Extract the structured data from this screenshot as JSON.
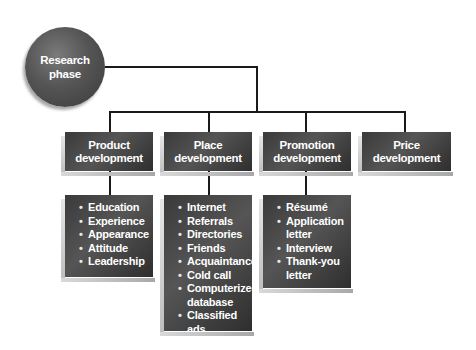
{
  "root": {
    "label_line1": "Research",
    "label_line2": "phase"
  },
  "categories": [
    {
      "line1": "Product",
      "line2": "development",
      "items": [
        "Education",
        "Experience",
        "Appearance",
        "Attitude",
        "Leadership"
      ]
    },
    {
      "line1": "Place",
      "line2": "development",
      "items": [
        "Internet",
        "Referrals",
        "Directories",
        "Friends",
        "Acquaintances",
        "Cold call",
        "Computerized database",
        "Classified ads"
      ]
    },
    {
      "line1": "Promotion",
      "line2": "development",
      "items": [
        "Résumé",
        "Application letter",
        "Interview",
        "Thank-you letter"
      ]
    },
    {
      "line1": "Price",
      "line2": "development",
      "items": []
    }
  ],
  "colors": {
    "box": "#454545",
    "line": "#1a1a1a",
    "text": "#ffffff"
  }
}
